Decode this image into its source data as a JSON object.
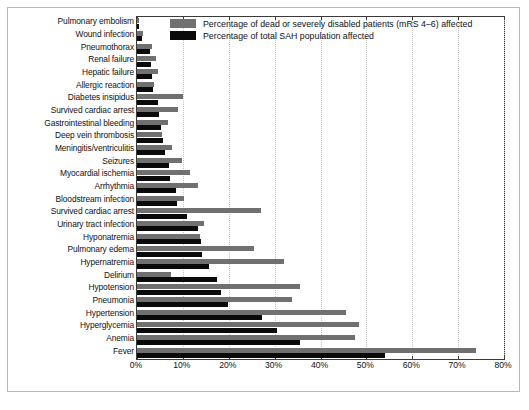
{
  "chart_data": {
    "type": "bar",
    "orientation": "horizontal",
    "title": "",
    "subtitle": "",
    "xlabel": "",
    "ylabel": "",
    "xlim": [
      0,
      80
    ],
    "xticks": [
      0,
      10,
      20,
      30,
      40,
      50,
      60,
      70,
      80
    ],
    "xticklabels": [
      "0%",
      "10%",
      "20%",
      "30%",
      "40%",
      "50%",
      "60%",
      "70%",
      "80%"
    ],
    "grid": true,
    "grid_axis": "x",
    "legend_position": "top-right-inside",
    "colors": {
      "series_dead_disabled": "#707070",
      "series_total_sah": "#0a0a0a",
      "axis": "#3a3a3a",
      "grid": "#c4c4c4",
      "frame": "#b8b8b8",
      "text": "#111111",
      "background": "#ffffff"
    },
    "categories": [
      "Pulmonary embolism",
      "Wound infection",
      "Pneumothorax",
      "Renal failure",
      "Hepatic failure",
      "Allergic reaction",
      "Diabetes insipidus",
      "Survived cardiac arrest",
      "Gastrointestinal bleeding",
      "Deep vein thrombosis",
      "Meningitis/ventriculitis",
      "Seizures",
      "Myocardial ischemia",
      "Arrhythmia",
      "Bloodstream infection",
      "Survived cardiac arrest",
      "Urinary tract infection",
      "Hyponatremia",
      "Pulmonary edema",
      "Hypernatremia",
      "Delirium",
      "Hypotension",
      "Pneumonia",
      "Hypertension",
      "Hyperglycemia",
      "Anemia",
      "Fever"
    ],
    "series": [
      {
        "name": "Percentage of dead or severely disabled patients (mRS 4–6) affected",
        "color": "#707070",
        "values": [
          0.5,
          1.2,
          3.3,
          4.2,
          4.6,
          3.8,
          10.0,
          9.0,
          6.8,
          5.5,
          7.6,
          9.9,
          11.5,
          13.2,
          10.3,
          27.0,
          14.6,
          13.8,
          25.5,
          32.0,
          7.5,
          35.6,
          33.8,
          45.5,
          48.3,
          47.5,
          74.0
        ]
      },
      {
        "name": "Percentage of total SAH population affected",
        "color": "#0a0a0a",
        "values": [
          0.4,
          1.0,
          2.8,
          3.0,
          3.2,
          3.4,
          4.6,
          4.8,
          5.3,
          5.6,
          6.2,
          7.0,
          7.3,
          8.6,
          8.8,
          10.9,
          13.3,
          14.0,
          14.2,
          15.8,
          17.5,
          18.4,
          19.9,
          27.2,
          30.6,
          35.6,
          54.0
        ]
      }
    ]
  },
  "legend": {
    "items": [
      {
        "swatch": "gray",
        "label": "Percentage of dead or severely disabled patients (mRS 4–6) affected"
      },
      {
        "swatch": "dark",
        "label": "Percentage of total SAH population affected"
      }
    ]
  }
}
